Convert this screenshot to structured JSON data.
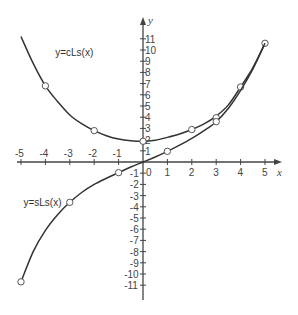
{
  "chart_data": {
    "type": "line",
    "title": "",
    "xlabel": "x",
    "ylabel": "y",
    "xlim": [
      -5,
      5
    ],
    "ylim": [
      -11,
      11
    ],
    "grid": false,
    "x_ticks": [
      -5,
      -4,
      -3,
      -2,
      -1,
      0,
      1,
      2,
      3,
      4,
      5
    ],
    "y_ticks": [
      -11,
      -10,
      -9,
      -8,
      -7,
      -6,
      -5,
      -4,
      -3,
      -2,
      -1,
      1,
      2,
      3,
      4,
      5,
      6,
      7,
      8,
      9,
      10,
      11
    ],
    "origin_label": "0",
    "series": [
      {
        "name": "y=cLs(x)",
        "label_position": [
          -3.6,
          9.5
        ],
        "color": "#333333",
        "curve": [
          [
            -5.0,
            11.2
          ],
          [
            -4.5,
            8.8
          ],
          [
            -4.0,
            6.8
          ],
          [
            -3.5,
            5.4
          ],
          [
            -3.0,
            4.2
          ],
          [
            -2.5,
            3.4
          ],
          [
            -2.0,
            2.8
          ],
          [
            -1.5,
            2.35
          ],
          [
            -1.0,
            2.05
          ],
          [
            -0.5,
            1.9
          ],
          [
            0.0,
            1.85
          ],
          [
            0.5,
            1.95
          ],
          [
            1.0,
            2.2
          ],
          [
            1.5,
            2.5
          ],
          [
            2.0,
            2.9
          ],
          [
            2.5,
            3.4
          ],
          [
            3.0,
            4.1
          ],
          [
            3.5,
            5.1
          ],
          [
            4.0,
            6.7
          ],
          [
            4.5,
            8.4
          ],
          [
            5.0,
            10.6
          ]
        ],
        "marked_points": [
          [
            -4.0,
            6.8
          ],
          [
            -2.0,
            2.8
          ],
          [
            0.0,
            1.85
          ],
          [
            2.0,
            2.9
          ],
          [
            3.0,
            3.95
          ],
          [
            4.0,
            6.7
          ],
          [
            5.0,
            10.6
          ]
        ]
      },
      {
        "name": "y=sLs(x)",
        "label_position": [
          -4.9,
          -3.9
        ],
        "color": "#333333",
        "curve": [
          [
            -5.0,
            -10.7
          ],
          [
            -4.5,
            -8.0
          ],
          [
            -4.0,
            -6.1
          ],
          [
            -3.5,
            -4.7
          ],
          [
            -3.0,
            -3.6
          ],
          [
            -2.5,
            -2.7
          ],
          [
            -2.0,
            -2.0
          ],
          [
            -1.5,
            -1.45
          ],
          [
            -1.0,
            -0.95
          ],
          [
            -0.5,
            -0.45
          ],
          [
            0.0,
            0.0
          ],
          [
            0.5,
            0.45
          ],
          [
            1.0,
            0.95
          ],
          [
            1.5,
            1.5
          ],
          [
            2.0,
            2.1
          ],
          [
            2.5,
            2.8
          ],
          [
            3.0,
            3.6
          ],
          [
            3.5,
            4.8
          ],
          [
            4.0,
            6.4
          ],
          [
            4.5,
            8.3
          ],
          [
            5.0,
            10.6
          ]
        ],
        "marked_points": [
          [
            -5.0,
            -10.7
          ],
          [
            -3.0,
            -3.6
          ],
          [
            -1.0,
            -0.95
          ],
          [
            1.0,
            0.95
          ],
          [
            3.0,
            3.6
          ]
        ]
      }
    ]
  }
}
